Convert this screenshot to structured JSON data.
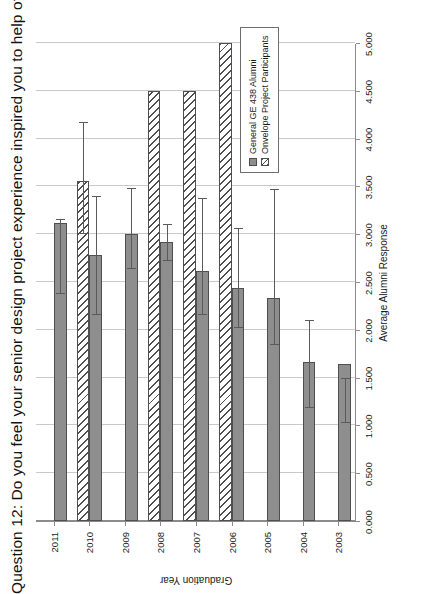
{
  "chart_data": {
    "type": "bar",
    "orientation": "horizontal-rotated",
    "title": "Question 12: Do you feel your senior design project experience inspired you to help others?",
    "categories": [
      "2003",
      "2004",
      "2005",
      "2006",
      "2007",
      "2008",
      "2009",
      "2010",
      "2011"
    ],
    "xlabel": "Graduation Year",
    "ylabel": "Average Alumni Response",
    "ylim": [
      0.0,
      5.0
    ],
    "yticks": [
      "0.000",
      "0.500",
      "1.000",
      "1.500",
      "2.000",
      "2.500",
      "3.000",
      "3.500",
      "4.000",
      "4.500",
      "5.000"
    ],
    "ytick_values": [
      0.0,
      0.5,
      1.0,
      1.5,
      2.0,
      2.5,
      3.0,
      3.5,
      4.0,
      4.5,
      5.0
    ],
    "grid": true,
    "legend_position": "inside-lower-left",
    "series": [
      {
        "name": "General GE 438 Alumni",
        "color": "#8e8e8e",
        "pattern": "solid",
        "values": [
          1.64,
          1.66,
          2.33,
          2.44,
          2.62,
          2.92,
          3.0,
          2.78,
          3.12
        ],
        "err_low": [
          1.5,
          2.1,
          3.47,
          3.07,
          3.38,
          3.11,
          3.48,
          3.4,
          3.16
        ],
        "err_high": [
          1.02,
          1.18,
          1.84,
          2.02,
          2.15,
          2.72,
          2.64,
          2.16,
          2.37
        ]
      },
      {
        "name": "Onvelope Project Participants",
        "color": "#ffffff",
        "pattern": "diagonal-hatch",
        "values": [
          null,
          null,
          null,
          5.0,
          4.5,
          4.5,
          null,
          3.56,
          null
        ],
        "err_low": [
          null,
          null,
          null,
          5.0,
          5.0,
          5.0,
          null,
          4.17,
          null
        ],
        "err_high": [
          null,
          null,
          null,
          5.0,
          5.0,
          5.0,
          null,
          3.0,
          null
        ]
      }
    ]
  },
  "legend": {
    "items": [
      {
        "label": "General GE 438 Alumni",
        "swatch": "series-a"
      },
      {
        "label": "Onvelope Project Participants",
        "swatch": "series-b"
      }
    ]
  }
}
